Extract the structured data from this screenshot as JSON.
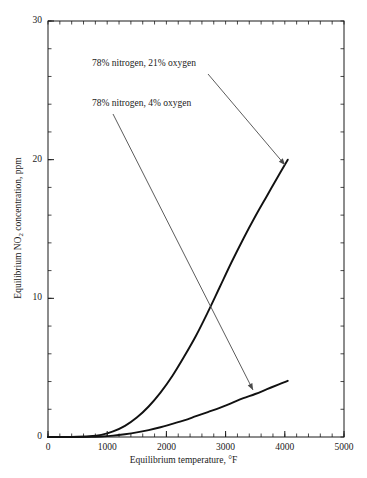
{
  "chart_data": {
    "type": "line",
    "title": "",
    "xlabel": "Equilibrium temperature, °F",
    "ylabel_prefix": "Equilibrium NO",
    "ylabel_sub": "2",
    "ylabel_suffix": " concentration, ppm",
    "ylabel": "Equilibrium NO2 concentration, ppm",
    "xlim": [
      0,
      5000
    ],
    "ylim": [
      0,
      30
    ],
    "xticks": [
      0,
      1000,
      2000,
      3000,
      4000,
      5000
    ],
    "yticks": [
      0,
      10,
      20,
      30
    ],
    "xtick_labels": [
      "0",
      "1000",
      "2000",
      "3000",
      "4000",
      "5000"
    ],
    "ytick_labels": [
      "0",
      "10",
      "20",
      "30"
    ],
    "x_minor_step": 200,
    "y_minor_step": 2,
    "grid": false,
    "legend": "annotations",
    "series": [
      {
        "name": "78% nitrogen, 21% oxygen",
        "points": [
          [
            0,
            0.0
          ],
          [
            400,
            0.01
          ],
          [
            700,
            0.05
          ],
          [
            900,
            0.15
          ],
          [
            1100,
            0.4
          ],
          [
            1300,
            0.8
          ],
          [
            1500,
            1.4
          ],
          [
            1700,
            2.2
          ],
          [
            1900,
            3.2
          ],
          [
            2100,
            4.4
          ],
          [
            2300,
            5.8
          ],
          [
            2500,
            7.3
          ],
          [
            2700,
            9.0
          ],
          [
            2900,
            10.8
          ],
          [
            3100,
            12.6
          ],
          [
            3300,
            14.3
          ],
          [
            3500,
            15.9
          ],
          [
            3700,
            17.4
          ],
          [
            3900,
            18.9
          ],
          [
            4050,
            20.0
          ]
        ]
      },
      {
        "name": "78% nitrogen, 4% oxygen",
        "points": [
          [
            0,
            0.0
          ],
          [
            400,
            0.0
          ],
          [
            700,
            0.01
          ],
          [
            900,
            0.04
          ],
          [
            1100,
            0.1
          ],
          [
            1300,
            0.2
          ],
          [
            1500,
            0.33
          ],
          [
            1700,
            0.5
          ],
          [
            1900,
            0.7
          ],
          [
            2100,
            0.95
          ],
          [
            2300,
            1.2
          ],
          [
            2500,
            1.5
          ],
          [
            2700,
            1.8
          ],
          [
            2900,
            2.1
          ],
          [
            3100,
            2.45
          ],
          [
            3300,
            2.8
          ],
          [
            3500,
            3.1
          ],
          [
            3700,
            3.45
          ],
          [
            3900,
            3.8
          ],
          [
            4050,
            4.05
          ]
        ]
      }
    ],
    "annotations": [
      {
        "text": "78% nitrogen, 21% oxygen",
        "text_x": 92,
        "text_y": 58,
        "arrow_from": [
          208,
          74
        ],
        "arrow_to": [
          285,
          165
        ]
      },
      {
        "text": "78% nitrogen, 4% oxygen",
        "text_x": 92,
        "text_y": 98,
        "arrow_from": [
          113,
          114
        ],
        "arrow_to": [
          253,
          390
        ]
      }
    ]
  },
  "colors": {
    "axis": "#1a1a1a",
    "curve": "#111111",
    "annotation_line": "#4a4a4a",
    "background": "#ffffff"
  }
}
